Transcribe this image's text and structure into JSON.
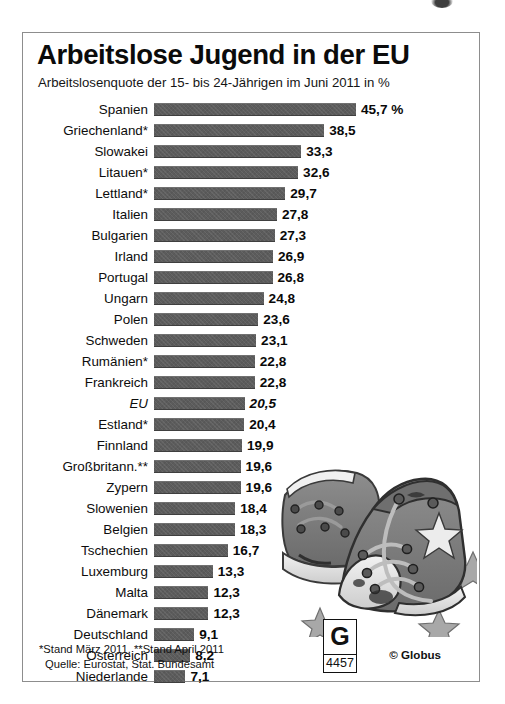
{
  "header": {
    "title": "Arbeitslose Jugend in der EU",
    "subtitle": "Arbeitslosenquote der 15- bis 24-Jährigen im Juni 2011 in %"
  },
  "footer": {
    "note_line1": "*Stand März 2011, **Stand April 2011",
    "note_line2": "Quelle: Eurostat, Stat. Bundesamt",
    "logo_letter": "G",
    "logo_number": "4457",
    "copyright": "© Globus"
  },
  "colors": {
    "bar": "#5c5c5c",
    "text": "#0d0d0d",
    "frame": "#8d8d8d",
    "background": "#ffffff"
  },
  "chart_data": {
    "type": "bar",
    "orientation": "horizontal",
    "title": "Arbeitslose Jugend in der EU",
    "subtitle": "Arbeitslosenquote der 15- bis 24-Jährigen im Juni 2011 in %",
    "xlabel": "",
    "ylabel": "",
    "unit": "%",
    "xlim": [
      0,
      45.7
    ],
    "grid": false,
    "legend": false,
    "categories": [
      "Spanien",
      "Griechenland*",
      "Slowakei",
      "Litauen*",
      "Lettland*",
      "Italien",
      "Bulgarien",
      "Irland",
      "Portugal",
      "Ungarn",
      "Polen",
      "Schweden",
      "Rumänien*",
      "Frankreich",
      "EU",
      "Estland*",
      "Finnland",
      "Großbritann.**",
      "Zypern",
      "Slowenien",
      "Belgien",
      "Tschechien",
      "Luxemburg",
      "Malta",
      "Dänemark",
      "Deutschland",
      "Österreich",
      "Niederlande"
    ],
    "values": [
      45.7,
      38.5,
      33.3,
      32.6,
      29.7,
      27.8,
      27.3,
      26.9,
      26.8,
      24.8,
      23.6,
      23.1,
      22.8,
      22.8,
      20.5,
      20.4,
      19.9,
      19.6,
      19.6,
      18.4,
      18.3,
      16.7,
      13.3,
      12.3,
      12.3,
      9.1,
      8.2,
      7.1
    ],
    "value_labels": [
      "45,7 %",
      "38,5",
      "33,3",
      "32,6",
      "29,7",
      "27,8",
      "27,3",
      "26,9",
      "26,8",
      "24,8",
      "23,6",
      "23,1",
      "22,8",
      "22,8",
      "20,5",
      "20,4",
      "19,9",
      "19,6",
      "19,6",
      "18,4",
      "18,3",
      "16,7",
      "13,3",
      "12,3",
      "12,3",
      "9,1",
      "8,2",
      "7,1"
    ],
    "highlight_category": "EU"
  }
}
